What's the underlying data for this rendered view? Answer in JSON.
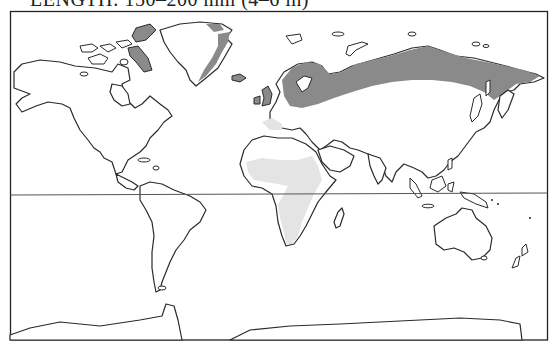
{
  "caption": {
    "text": "LENGTH: 150–200 mm (4–6 in)"
  },
  "map": {
    "projection": "world-outline",
    "frame": {
      "left": 10,
      "top": 11,
      "right": 548,
      "bottom": 340
    },
    "equator_y": 195,
    "colors": {
      "background": "#ffffff",
      "outline": "#2a2a2a",
      "breeding_range": "#8a8a8a",
      "wintering_range": "#e4e4e4"
    },
    "ranges": [
      {
        "name": "breeding-range",
        "shade": "dark",
        "regions": [
          "Arctic Canada islands",
          "East Greenland",
          "Iceland",
          "British Isles",
          "Scandinavia",
          "Northern Russia",
          "Northern Siberia",
          "Chukotka"
        ]
      },
      {
        "name": "wintering-range",
        "shade": "light",
        "regions": [
          "Sub-Saharan Africa",
          "East Africa",
          "Southern Africa",
          "Mediterranean coast"
        ]
      }
    ]
  }
}
